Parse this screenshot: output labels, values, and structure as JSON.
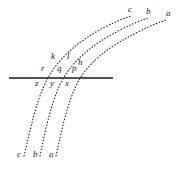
{
  "figure": {
    "kind": "geometry-diagram",
    "background_color": "#ffffff",
    "ink_color": "#1a1a1a",
    "line": {
      "name": "horizontal-transversal",
      "x1": 9,
      "y1": 78,
      "x2": 113,
      "y2": 78,
      "stroke_width": 1.6,
      "style": "solid"
    },
    "curves": [
      {
        "id": "curve-c",
        "style": "dotted",
        "top_label": "c",
        "bottom_label": "c",
        "above_line_label": "k",
        "at_line_label": "r",
        "below_line_label": "z",
        "path": "M 24,156 C 31,126 36,104 44,86 C 54,62 76,42 105,27 C 117,21 125,18 131,16"
      },
      {
        "id": "curve-b",
        "style": "dotted",
        "top_label": "b",
        "bottom_label": "b",
        "above_line_label": "l",
        "at_line_label": "q",
        "below_line_label": "y",
        "path": "M 40,156 C 46,127 51,105 59,87 C 69,63 92,44 122,29 C 134,23 142,20 148,18"
      },
      {
        "id": "curve-a",
        "style": "dotted",
        "top_label": "a",
        "bottom_label": "a",
        "above_line_label": "h",
        "at_line_label": "p",
        "below_line_label": "x",
        "path": "M 56,156 C 62,128 67,106 75,88 C 85,64 109,46 140,31 C 152,25 160,22 166,20"
      }
    ],
    "labels": [
      {
        "name": "label-top-c",
        "text": "c",
        "x": 128,
        "y": 12
      },
      {
        "name": "label-top-b",
        "text": "b",
        "x": 146,
        "y": 14
      },
      {
        "name": "label-top-a",
        "text": "a",
        "x": 166,
        "y": 16
      },
      {
        "name": "label-k",
        "text": "k",
        "x": 51,
        "y": 59
      },
      {
        "name": "label-l",
        "text": "l",
        "x": 66,
        "y": 59
      },
      {
        "name": "label-h",
        "text": "h",
        "x": 78,
        "y": 65
      },
      {
        "name": "label-r",
        "text": "r",
        "x": 41,
        "y": 71
      },
      {
        "name": "label-q",
        "text": "q",
        "x": 57,
        "y": 71
      },
      {
        "name": "label-p",
        "text": "p",
        "x": 72,
        "y": 71
      },
      {
        "name": "label-z",
        "text": "z",
        "x": 35,
        "y": 81
      },
      {
        "name": "label-y",
        "text": "y",
        "x": 50,
        "y": 81
      },
      {
        "name": "label-x",
        "text": "x",
        "x": 65,
        "y": 81
      },
      {
        "name": "label-bottom-c",
        "text": "c",
        "x": 17,
        "y": 157
      },
      {
        "name": "label-bottom-b",
        "text": "b",
        "x": 33,
        "y": 157
      },
      {
        "name": "label-bottom-a",
        "text": "a",
        "x": 49,
        "y": 157
      }
    ]
  }
}
